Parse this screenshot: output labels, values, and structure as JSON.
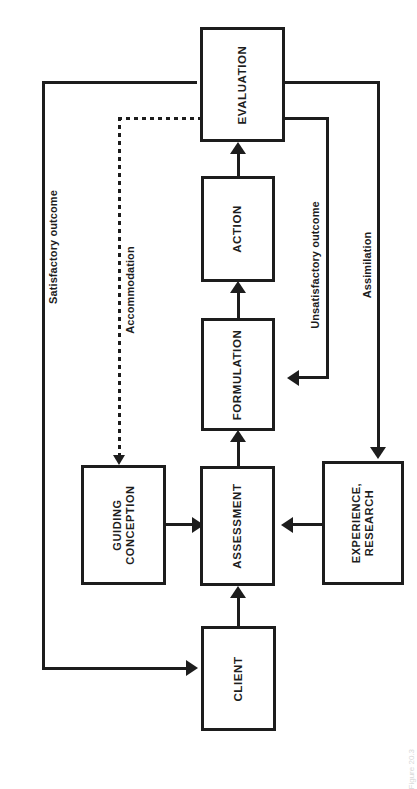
{
  "diagram": {
    "type": "flowchart",
    "orientation": "rotated-90-counterclockwise",
    "nodes": [
      {
        "id": "evaluation",
        "label": "EVALUATION"
      },
      {
        "id": "action",
        "label": "ACTION"
      },
      {
        "id": "formulation",
        "label": "FORMULATION"
      },
      {
        "id": "assessment",
        "label": "ASSESSMENT"
      },
      {
        "id": "guiding",
        "label_line1": "GUIDING",
        "label_line2": "CONCEPTION"
      },
      {
        "id": "experience",
        "label_line1": "EXPERIENCE,",
        "label_line2": "RESEARCH"
      },
      {
        "id": "client",
        "label": "CLIENT"
      }
    ],
    "edge_labels": {
      "satisfactory": "Satisfactory outcome",
      "accommodation": "Accommodation",
      "unsatisfactory": "Unsatisfactory outcome",
      "assimilation": "Assimilation"
    },
    "caption": "Figure 20.3"
  },
  "colors": {
    "stroke": "#1d1d1d",
    "fill": "#ffffff",
    "caption": "#d8d8d8"
  }
}
